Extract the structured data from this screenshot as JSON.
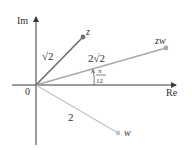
{
  "axes": {
    "real_label": "Re",
    "imag_label": "Im",
    "origin_label": "0"
  },
  "points": {
    "z": {
      "label": "z",
      "modulus_label": "√2",
      "color": "#6e6e6e"
    },
    "zw": {
      "label": "zw",
      "modulus_label": "2√2",
      "color": "#9a9a9a"
    },
    "w": {
      "label": "w",
      "modulus_label": "2",
      "color": "#bdbdbd"
    }
  },
  "angle": {
    "numerator": "π",
    "denominator": "12"
  },
  "colors": {
    "axis": "#3a3a3a",
    "text": "#333333"
  }
}
